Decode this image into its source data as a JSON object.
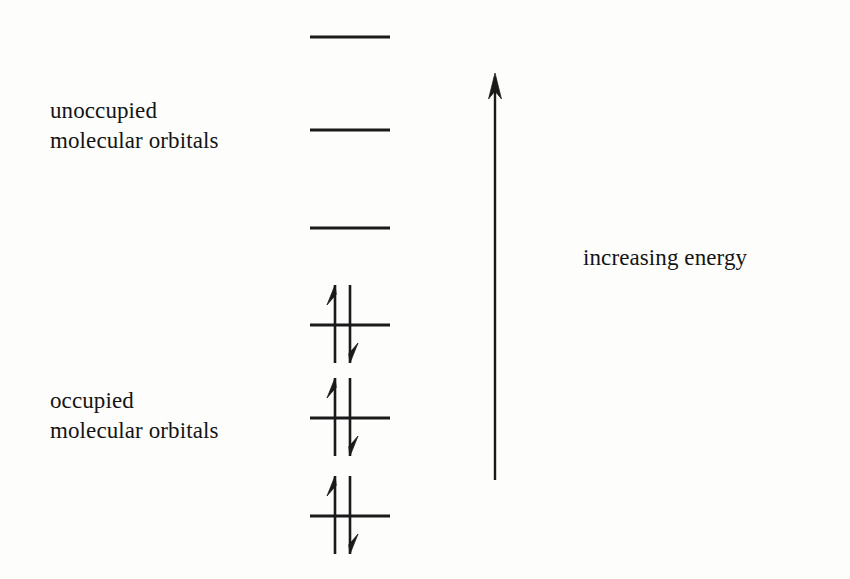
{
  "figure": {
    "background_color": "#fdfdfc",
    "ink_color": "#1a1a1a"
  },
  "labels": {
    "unoccupied": "unoccupied\nmolecular orbitals",
    "occupied": "occupied\nmolecular orbitals",
    "energy_axis": "increasing energy"
  },
  "energy_axis": {
    "direction": "up",
    "label": "increasing energy",
    "x": 495,
    "tail_y": 480,
    "tip_y": 73,
    "head_width": 13,
    "head_length": 26,
    "shaft_width": 2.4
  },
  "orbitals": {
    "line_left_x": 310,
    "line_right_x": 390,
    "line_thickness": 3.2,
    "unoccupied": [
      {
        "name": "unoccupied-level-3",
        "y": 37,
        "electrons": 0
      },
      {
        "name": "unoccupied-level-2",
        "y": 130,
        "electrons": 0
      },
      {
        "name": "unoccupied-level-1",
        "y": 228,
        "electrons": 0
      }
    ],
    "occupied": [
      {
        "name": "occupied-level-3",
        "y": 325,
        "electrons": 2
      },
      {
        "name": "occupied-level-2",
        "y": 418,
        "electrons": 2
      },
      {
        "name": "occupied-level-1",
        "y": 516,
        "electrons": 2
      }
    ]
  },
  "electron_pair": {
    "spin_up_x": 335,
    "spin_down_x": 350,
    "extent_above": 40,
    "extent_below": 38,
    "stroke_width": 2.6,
    "barb_length": 20,
    "barb_spread": 8,
    "spin_up_symbol": "up-arrow",
    "spin_down_symbol": "down-arrow"
  },
  "counts": {
    "unoccupied_levels": 3,
    "occupied_levels": 3,
    "total_electrons": 6
  }
}
